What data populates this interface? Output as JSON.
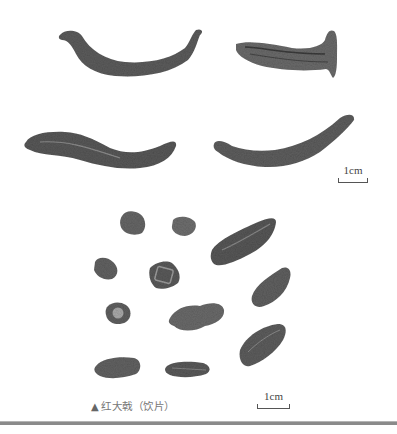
{
  "figure": {
    "caption_marker": "▲",
    "caption": "红大戟（饮片）",
    "background_color": "#ffffff",
    "specimen_color": "#5a5a5a",
    "rule_color": "#8a8a8a"
  },
  "scale_bars": [
    {
      "label": "1cm",
      "position": "top-right"
    },
    {
      "label": "1cm",
      "position": "bottom"
    }
  ],
  "sections": {
    "upper": {
      "description": "whole dried roots",
      "count": 4
    },
    "lower": {
      "description": "sliced pieces (饮片)",
      "count": 11
    }
  }
}
